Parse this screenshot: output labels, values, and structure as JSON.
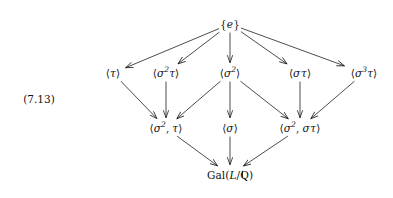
{
  "figure": {
    "equation_tag": "(7.13)",
    "background_color": "#ffffff",
    "ink_color": "#111111",
    "type": "hasse-diagram"
  },
  "nodes": [
    {
      "id": "e",
      "label": "{e}",
      "x": 230,
      "y": 24,
      "row": 0
    },
    {
      "id": "tau",
      "label": "⟨τ⟩",
      "x": 113,
      "y": 73,
      "row": 1
    },
    {
      "id": "s2tau",
      "label": "⟨σ²τ⟩",
      "x": 166,
      "y": 73,
      "row": 1
    },
    {
      "id": "s2",
      "label": "⟨σ²⟩",
      "x": 230,
      "y": 73,
      "row": 1
    },
    {
      "id": "stau",
      "label": "⟨στ⟩",
      "x": 300,
      "y": 73,
      "row": 1
    },
    {
      "id": "s3tau",
      "label": "⟨σ³τ⟩",
      "x": 364,
      "y": 73,
      "row": 1
    },
    {
      "id": "s2_tau",
      "label": "⟨σ², τ⟩",
      "x": 166,
      "y": 128,
      "row": 2
    },
    {
      "id": "sigma",
      "label": "⟨σ⟩",
      "x": 230,
      "y": 128,
      "row": 2
    },
    {
      "id": "s2_stau",
      "label": "⟨σ², στ⟩",
      "x": 300,
      "y": 128,
      "row": 2
    },
    {
      "id": "gal",
      "label": "Gal(L/ℚ)",
      "x": 230,
      "y": 175,
      "row": 3
    }
  ],
  "edges": [
    {
      "from": "e",
      "to": "tau"
    },
    {
      "from": "e",
      "to": "s2tau"
    },
    {
      "from": "e",
      "to": "s2"
    },
    {
      "from": "e",
      "to": "stau"
    },
    {
      "from": "e",
      "to": "s3tau"
    },
    {
      "from": "tau",
      "to": "s2_tau"
    },
    {
      "from": "s2tau",
      "to": "s2_tau"
    },
    {
      "from": "s2",
      "to": "s2_tau"
    },
    {
      "from": "s2",
      "to": "sigma"
    },
    {
      "from": "s2",
      "to": "s2_stau"
    },
    {
      "from": "stau",
      "to": "s2_stau"
    },
    {
      "from": "s3tau",
      "to": "s2_stau"
    },
    {
      "from": "s2_tau",
      "to": "gal"
    },
    {
      "from": "sigma",
      "to": "gal"
    },
    {
      "from": "s2_stau",
      "to": "gal"
    }
  ],
  "equation_tag_position": {
    "x": 39,
    "y": 99
  }
}
